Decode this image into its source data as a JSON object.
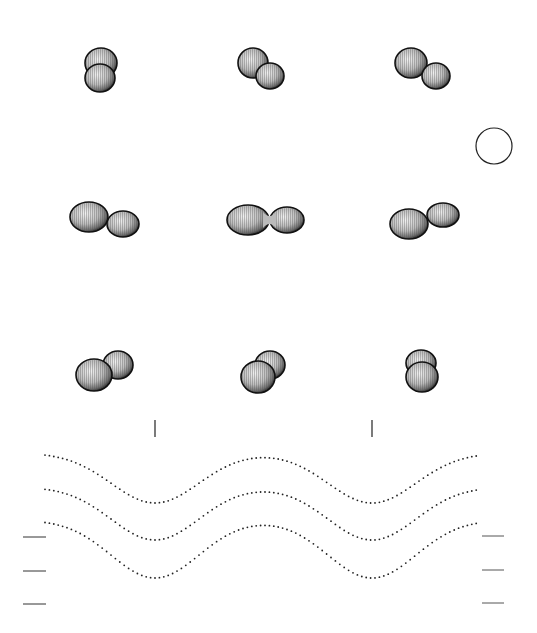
{
  "figure": {
    "width": 537,
    "height": 633,
    "background": "#ffffff",
    "ink": "#1a1a1a",
    "sphere_fill_light": "#e6e6e6",
    "sphere_fill_dark": "#8a8a8a",
    "sphere_rim": "#111111"
  },
  "binary_views": [
    {
      "row": 0,
      "col": 0,
      "primary": {
        "cx": 101,
        "cy": 63,
        "rx": 16,
        "ry": 15
      },
      "secondary": {
        "cx": 100,
        "cy": 78,
        "rx": 15,
        "ry": 14
      },
      "front": "secondary"
    },
    {
      "row": 0,
      "col": 1,
      "primary": {
        "cx": 253,
        "cy": 63,
        "rx": 15,
        "ry": 15
      },
      "secondary": {
        "cx": 270,
        "cy": 76,
        "rx": 14,
        "ry": 13
      },
      "front": "secondary"
    },
    {
      "row": 0,
      "col": 2,
      "primary": {
        "cx": 411,
        "cy": 63,
        "rx": 16,
        "ry": 15
      },
      "secondary": {
        "cx": 436,
        "cy": 76,
        "rx": 14,
        "ry": 13
      },
      "front": "secondary"
    },
    {
      "row": 1,
      "col": 0,
      "primary": {
        "cx": 89,
        "cy": 217,
        "rx": 19,
        "ry": 15
      },
      "secondary": {
        "cx": 123,
        "cy": 224,
        "rx": 16,
        "ry": 13
      },
      "front": "secondary"
    },
    {
      "row": 1,
      "col": 1,
      "primary": {
        "cx": 248,
        "cy": 220,
        "rx": 21,
        "ry": 15
      },
      "secondary": {
        "cx": 287,
        "cy": 220,
        "rx": 17,
        "ry": 13
      },
      "front": "none",
      "contact": true
    },
    {
      "row": 1,
      "col": 2,
      "primary": {
        "cx": 409,
        "cy": 224,
        "rx": 19,
        "ry": 15
      },
      "secondary": {
        "cx": 443,
        "cy": 215,
        "rx": 16,
        "ry": 12
      },
      "front": "primary"
    },
    {
      "row": 2,
      "col": 0,
      "primary": {
        "cx": 94,
        "cy": 375,
        "rx": 18,
        "ry": 16
      },
      "secondary": {
        "cx": 118,
        "cy": 365,
        "rx": 15,
        "ry": 14
      },
      "front": "primary"
    },
    {
      "row": 2,
      "col": 1,
      "primary": {
        "cx": 258,
        "cy": 377,
        "rx": 17,
        "ry": 16
      },
      "secondary": {
        "cx": 270,
        "cy": 365,
        "rx": 15,
        "ry": 14
      },
      "front": "primary"
    },
    {
      "row": 2,
      "col": 2,
      "primary": {
        "cx": 422,
        "cy": 377,
        "rx": 16,
        "ry": 15
      },
      "secondary": {
        "cx": 421,
        "cy": 363,
        "rx": 15,
        "ry": 13
      },
      "front": "primary"
    }
  ],
  "scale_circle": {
    "cx": 494,
    "cy": 146,
    "r": 18
  },
  "phase_markers": [
    {
      "x": 155,
      "y1": 420,
      "y2": 437
    },
    {
      "x": 372,
      "y1": 420,
      "y2": 437
    }
  ],
  "left_ticks": [
    {
      "x1": 23,
      "x2": 46,
      "y": 537
    },
    {
      "x1": 23,
      "x2": 46,
      "y": 571
    },
    {
      "x1": 23,
      "x2": 46,
      "y": 604
    }
  ],
  "right_ticks": [
    {
      "x1": 482,
      "x2": 504,
      "y": 536
    },
    {
      "x1": 482,
      "x2": 504,
      "y": 570
    },
    {
      "x1": 482,
      "x2": 504,
      "y": 603
    }
  ],
  "chart_data": {
    "type": "line",
    "title": "",
    "xlabel": "",
    "ylabel": "",
    "style": "dotted",
    "grid": false,
    "legend": "none",
    "x_pixel_range": [
      45,
      478
    ],
    "minima_x": [
      155,
      372
    ],
    "maxima_x": [
      45,
      265,
      478
    ],
    "series": [
      {
        "name": "curve-1",
        "baseline_y": 453,
        "minimum_y": 503
      },
      {
        "name": "curve-2",
        "baseline_y": 487,
        "minimum_y": 540
      },
      {
        "name": "curve-3",
        "baseline_y": 520,
        "minimum_y": 578
      }
    ]
  }
}
